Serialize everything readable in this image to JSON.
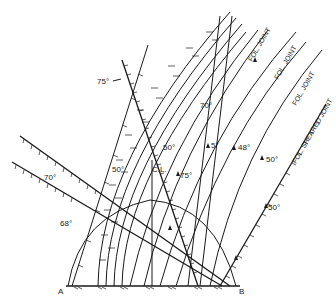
{
  "diagram": {
    "points": {
      "a": "A",
      "b": "B"
    },
    "center_line": "C.L.",
    "dips": {
      "d75_top": "75°",
      "d70_left": "70°",
      "d68_left": "68°",
      "d50_a": "50°",
      "d50_b": "50°",
      "d70_mid": "70°",
      "d75_mid": "75°",
      "d5": "5°",
      "d48": "48°",
      "d50_c": "50°",
      "d50_d": "50°"
    },
    "joints": {
      "j1": "FOL. JOINT",
      "j2": "FOL. JOINT",
      "j3": "FOL. JOINT",
      "j4": "FOL. SHEARED JOINT"
    }
  }
}
